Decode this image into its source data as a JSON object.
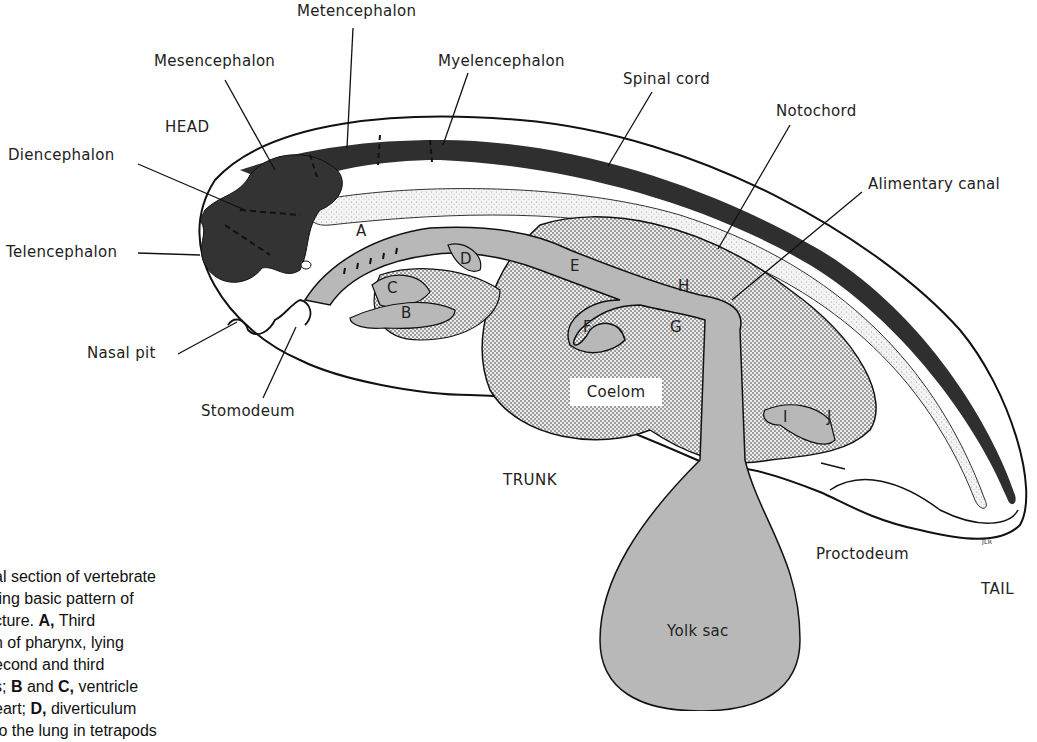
{
  "figure": {
    "regions": {
      "head": "HEAD",
      "trunk": "TRUNK",
      "tail": "TAIL"
    },
    "labels": {
      "metencephalon": "Metencephalon",
      "mesencephalon": "Mesencephalon",
      "myelencephalon": "Myelencephalon",
      "spinal_cord": "Spinal cord",
      "notochord": "Notochord",
      "alimentary_canal": "Alimentary canal",
      "diencephalon": "Diencephalon",
      "telencephalon": "Telencephalon",
      "nasal_pit": "Nasal pit",
      "stomodeum": "Stomodeum",
      "coelom": "Coelom",
      "proctodeum": "Proctodeum",
      "yolk_sac": "Yolk sac",
      "signature": "JLR"
    },
    "letters": {
      "A": "A",
      "B": "B",
      "C": "C",
      "D": "D",
      "E": "E",
      "F": "F",
      "G": "G",
      "H": "H",
      "I": "I",
      "J": "J"
    },
    "colors": {
      "brain": "#3a3a3a",
      "gut": "#b8b8b8",
      "coelom_stipple": "#d9d9d9",
      "notochord_stipple": "#ececec",
      "outline": "#111111"
    }
  },
  "caption": {
    "line1": "al section of vertebrate",
    "line2": "ting basic pattern of",
    "line3_pre": "cture. ",
    "line3_bold": "A,",
    "line3_post": " Third",
    "line4": "h of pharynx, lying",
    "line5": "econd and third",
    "line6_pre": "s; ",
    "line6_b1": "B",
    "line6_mid": " and ",
    "line6_b2": "C,",
    "line6_post": " ventricle",
    "line7_pre": "eart; ",
    "line7_bold": "D,",
    "line7_post": " diverticulum",
    "line8": "to the lung in tetrapods"
  }
}
